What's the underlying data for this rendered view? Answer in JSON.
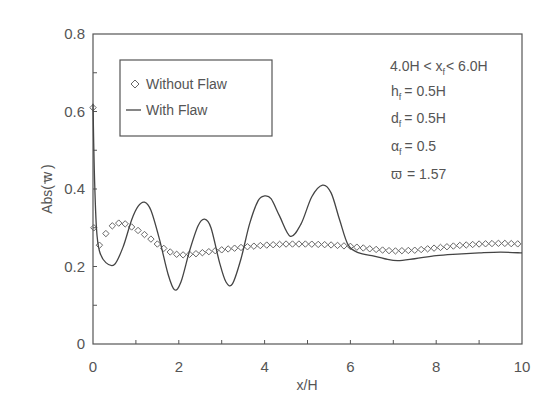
{
  "chart_data": {
    "type": "line",
    "title": "",
    "xlabel": "x/H",
    "ylabel": "Abs( w̄ )",
    "xlim": [
      0,
      10
    ],
    "ylim": [
      0,
      0.8
    ],
    "x_ticks": [
      "0",
      "2",
      "4",
      "6",
      "8",
      "10"
    ],
    "y_ticks": [
      "0",
      "0.2",
      "0.4",
      "0.6",
      "0.8"
    ],
    "grid": false,
    "legend_position": "upper-left (inside)",
    "legend": [
      {
        "label": "Without Flaw",
        "marker": "diamond"
      },
      {
        "label": "With Flaw",
        "marker": "line"
      }
    ],
    "annotations": [
      "4.0H < x_f < 6.0H",
      "h_f = 0.5H",
      "d_f = 0.5H",
      "α_f = 0.5",
      "ϖ = 1.57"
    ],
    "series": [
      {
        "name": "Without Flaw",
        "style": "diamond markers",
        "x": [
          0.0,
          0.02,
          0.15,
          0.3,
          0.45,
          0.6,
          0.75,
          0.9,
          1.1,
          1.3,
          1.5,
          1.7,
          1.9,
          2.1,
          2.4,
          2.8,
          3.2,
          3.6,
          4.0,
          4.5,
          5.0,
          5.5,
          6.0,
          6.5,
          7.0,
          7.5,
          8.0,
          8.5,
          9.0,
          9.5,
          10.0
        ],
        "values": [
          0.61,
          0.3,
          0.255,
          0.285,
          0.305,
          0.312,
          0.31,
          0.302,
          0.29,
          0.275,
          0.258,
          0.243,
          0.232,
          0.23,
          0.233,
          0.24,
          0.246,
          0.251,
          0.255,
          0.258,
          0.258,
          0.256,
          0.252,
          0.245,
          0.24,
          0.242,
          0.248,
          0.254,
          0.258,
          0.26,
          0.258
        ]
      },
      {
        "name": "With Flaw",
        "style": "solid line",
        "x": [
          0.0,
          0.03,
          0.08,
          0.15,
          0.3,
          0.5,
          0.7,
          0.9,
          1.05,
          1.2,
          1.35,
          1.55,
          1.75,
          1.9,
          2.05,
          2.25,
          2.45,
          2.6,
          2.75,
          2.95,
          3.1,
          3.25,
          3.45,
          3.65,
          3.85,
          4.0,
          4.15,
          4.35,
          4.6,
          4.85,
          5.1,
          5.35,
          5.55,
          5.75,
          5.95,
          6.2,
          6.5,
          6.8,
          7.1,
          7.5,
          8.0,
          8.5,
          9.0,
          9.5,
          10.0
        ],
        "values": [
          0.62,
          0.45,
          0.3,
          0.24,
          0.21,
          0.205,
          0.25,
          0.32,
          0.355,
          0.366,
          0.345,
          0.27,
          0.18,
          0.14,
          0.16,
          0.24,
          0.305,
          0.322,
          0.3,
          0.21,
          0.16,
          0.155,
          0.22,
          0.31,
          0.37,
          0.382,
          0.375,
          0.33,
          0.278,
          0.31,
          0.38,
          0.41,
          0.39,
          0.32,
          0.255,
          0.235,
          0.228,
          0.22,
          0.215,
          0.22,
          0.228,
          0.232,
          0.235,
          0.237,
          0.235
        ]
      }
    ]
  },
  "axes": {
    "xlabel": "x/H",
    "ylabel_main": "Abs(",
    "ylabel_var": "w",
    "ylabel_close": ")"
  },
  "legend": {
    "items": [
      {
        "label": "Without Flaw"
      },
      {
        "label": "With Flaw"
      }
    ]
  },
  "params": {
    "line1_a": "4.0H < x",
    "line1_sub": "f",
    "line1_b": "< 6.0H",
    "line2_a": "h",
    "line2_sub": "f",
    "line2_b": "= 0.5H",
    "line3_a": "d",
    "line3_sub": "f",
    "line3_b": "= 0.5H",
    "line4_a": "α",
    "line4_sub": "f",
    "line4_b": "= 0.5",
    "line5_a": "ϖ",
    "line5_b": "= 1.57"
  },
  "colors": {
    "axis": "#555555",
    "line": "#444444",
    "marker": "#666666",
    "text": "#555555",
    "background": "#ffffff"
  }
}
